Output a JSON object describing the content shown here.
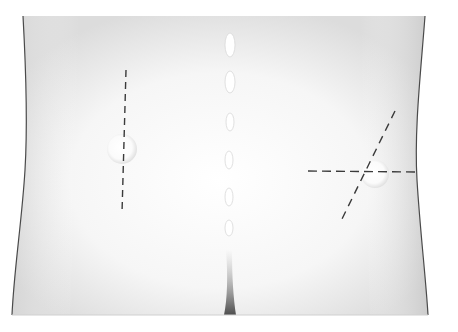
{
  "figure": {
    "annotations": [
      {
        "name": "left-vertical-incision",
        "style": "dashed",
        "x1": 126,
        "y1": 70,
        "x2": 122,
        "y2": 213
      },
      {
        "name": "right-oblique-incision",
        "style": "dashed",
        "x1": 395,
        "y1": 111,
        "x2": 341,
        "y2": 221
      },
      {
        "name": "right-horizontal-incision",
        "style": "dashed",
        "x1": 308,
        "y1": 171,
        "x2": 418,
        "y2": 172
      }
    ],
    "landmarks": [
      {
        "name": "left-dimple",
        "cx": 122,
        "cy": 149,
        "r": 15
      },
      {
        "name": "right-dimple",
        "cx": 375,
        "cy": 174,
        "r": 14
      }
    ],
    "colors": {
      "background": "#ffffff",
      "skin": "#f3f3f3",
      "shade": "#c9c9c9",
      "outline": "#4a4a4a",
      "dash": "#3a3a3a"
    }
  }
}
